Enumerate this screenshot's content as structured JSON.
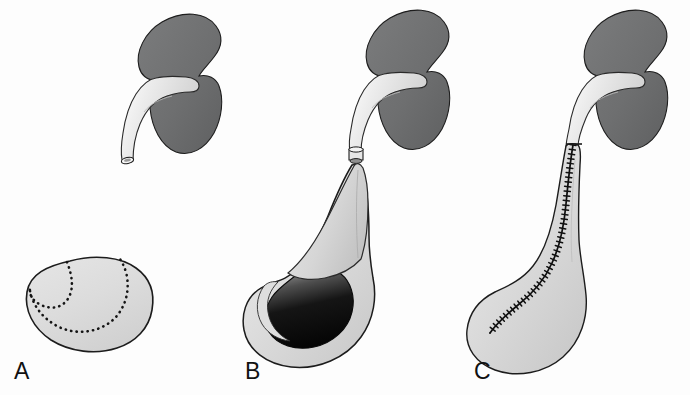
{
  "figure": {
    "background_color": "#fdfdfd",
    "width": 690,
    "height": 395
  },
  "colors": {
    "kidney_parenchyma": "#6e6f70",
    "kidney_parenchyma_shadow": "#5d5e5f",
    "kidney_parenchyma_highlight": "#818283",
    "pelvis_pale": "#dcdcdc",
    "pelvis_pale_light": "#ececec",
    "pelvis_shadow": "#c2c2c2",
    "cavity_dark": "#0b0b0b",
    "cavity_mid": "#4a4a4a",
    "outline": "#1a1a1a",
    "dotted_incision": "#151515",
    "suture_line": "#101010",
    "label_text": "#111111"
  },
  "panels": [
    {
      "id": "A",
      "label": "A",
      "caption": "Kidney with divided ureter and opened renal pelvis cross-section showing planned spiral incision",
      "structures": [
        {
          "name": "kidney-parenchyma",
          "fill": "#6e6f70",
          "description": "bean-shaped renal parenchyma, dark gray"
        },
        {
          "name": "renal-pelvis",
          "fill": "#dcdcdc",
          "description": "pale funnel-shaped renal pelvis emerging from hilum"
        },
        {
          "name": "ureter-stump",
          "fill": "#dcdcdc",
          "description": "divided proximal ureter with open cut lumen"
        },
        {
          "name": "pelvis-cross-section",
          "fill": "#dcdcdc",
          "description": "flattened rounded outline of opened pelvis"
        },
        {
          "name": "dotted-incision-line",
          "stroke": "#151515",
          "style": "dotted",
          "description": "S-shaped spiral incision marking across the pelvis"
        }
      ]
    },
    {
      "id": "B",
      "label": "B",
      "caption": "Spiral flap raised and rotated; opened pelvic cavity shown in dark interior",
      "structures": [
        {
          "name": "kidney-parenchyma",
          "fill": "#6e6f70",
          "description": "bean-shaped renal parenchyma, dark gray"
        },
        {
          "name": "renal-pelvis",
          "fill": "#dcdcdc",
          "description": "pale renal pelvis from hilum to ureteropelvic junction"
        },
        {
          "name": "ureter-anastomosis",
          "fill": "#dcdcdc",
          "description": "divided ureter end at the junction"
        },
        {
          "name": "spiral-flap",
          "fill": "#d5d5d5",
          "description": "elongated triangular flap elevated toward the ureter"
        },
        {
          "name": "opened-pelvis-cavity",
          "fill": "#0b0b0b",
          "description": "dark crescent cavity of the opened pelvis"
        },
        {
          "name": "pelvis-wall",
          "fill": "#dcdcdc",
          "description": "pale rounded pelvic wall surrounding the cavity"
        }
      ]
    },
    {
      "id": "C",
      "label": "C",
      "caption": "Completed reconstruction with running suture line along the tubularized spiral flap",
      "structures": [
        {
          "name": "kidney-parenchyma",
          "fill": "#6e6f70",
          "description": "bean-shaped renal parenchyma, dark gray"
        },
        {
          "name": "renal-pelvis",
          "fill": "#dcdcdc",
          "description": "pale renal pelvis from hilum"
        },
        {
          "name": "reconstructed-pelvis",
          "fill": "#dcdcdc",
          "description": "tear-drop shaped reconstructed pelvis and tapered ureter"
        },
        {
          "name": "suture-line",
          "stroke": "#101010",
          "style": "running-stitch",
          "stitch_count": 46,
          "description": "continuous running suture with cross ticks from the ureteropelvic junction down into the pelvis"
        }
      ]
    }
  ]
}
